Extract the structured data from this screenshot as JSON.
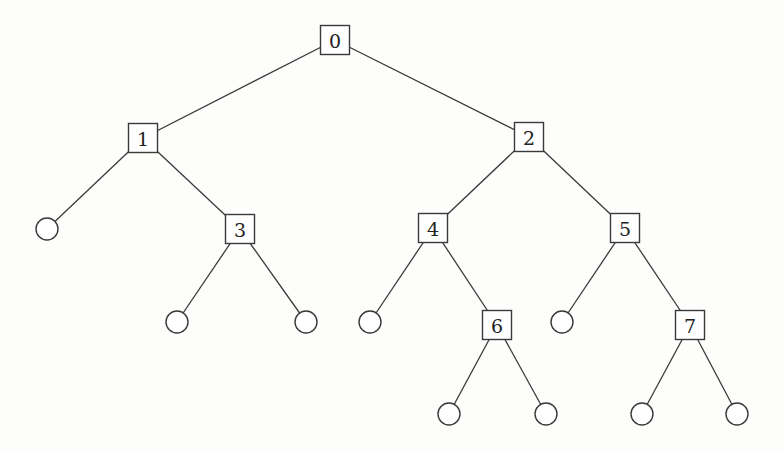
{
  "diagram": {
    "type": "binary-tree",
    "internal_nodes": [
      {
        "id": "0",
        "label": "0",
        "parent": null
      },
      {
        "id": "1",
        "label": "1",
        "parent": "0"
      },
      {
        "id": "2",
        "label": "2",
        "parent": "0"
      },
      {
        "id": "3",
        "label": "3",
        "parent": "1"
      },
      {
        "id": "4",
        "label": "4",
        "parent": "2"
      },
      {
        "id": "5",
        "label": "5",
        "parent": "2"
      },
      {
        "id": "6",
        "label": "6",
        "parent": "4"
      },
      {
        "id": "7",
        "label": "7",
        "parent": "5"
      }
    ],
    "leaves": [
      {
        "id": "L1",
        "parent": "1",
        "side": "left"
      },
      {
        "id": "L3a",
        "parent": "3",
        "side": "left"
      },
      {
        "id": "L3b",
        "parent": "3",
        "side": "right"
      },
      {
        "id": "L4",
        "parent": "4",
        "side": "left"
      },
      {
        "id": "L5",
        "parent": "5",
        "side": "left"
      },
      {
        "id": "L6a",
        "parent": "6",
        "side": "left"
      },
      {
        "id": "L6b",
        "parent": "6",
        "side": "right"
      },
      {
        "id": "L7a",
        "parent": "7",
        "side": "left"
      },
      {
        "id": "L7b",
        "parent": "7",
        "side": "right"
      }
    ],
    "internal_node_shape": "square",
    "leaf_node_shape": "circle",
    "colors": {
      "stroke": "#3a3a3a",
      "label": "#222222",
      "background": "#fdfdfc"
    }
  }
}
